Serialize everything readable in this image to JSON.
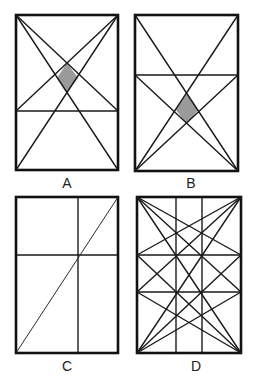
{
  "figure": {
    "panels": [
      {
        "id": "A",
        "label": "A",
        "rect": {
          "x": 16,
          "y": 15,
          "w": 102,
          "h": 155
        },
        "horizontals": [
          111
        ],
        "verticals": [],
        "shaded_region": true,
        "description": "Rectangle with horizontal line in lower part; both full diagonals plus lines from top corners to opposite ends of the horizontal line; shaded kite at intersection"
      },
      {
        "id": "B",
        "label": "B",
        "rect": {
          "x": 135,
          "y": 15,
          "w": 103,
          "h": 156
        },
        "horizontals": [
          75
        ],
        "verticals": [],
        "shaded_region": true,
        "description": "Rectangle with horizontal line in upper part; both full diagonals plus lines from bottom corners to opposite ends of the horizontal line; shaded kite at intersection"
      },
      {
        "id": "C",
        "label": "C",
        "rect": {
          "x": 16,
          "y": 197,
          "w": 102,
          "h": 156
        },
        "horizontals": [
          255
        ],
        "verticals": [
          78
        ],
        "shaded_region": false,
        "description": "Rectangle with one diagonal from bottom-left to top-right; horizontal and vertical lines cross on the diagonal"
      },
      {
        "id": "D",
        "label": "D",
        "rect": {
          "x": 137,
          "y": 197,
          "w": 104,
          "h": 156
        },
        "horizontals": [
          255,
          292
        ],
        "verticals": [
          176,
          202
        ],
        "shaded_region": false,
        "description": "Rectangle divided by two horizontal and two vertical lines; fans of lines from each corner to opposite corner and to the opposite side at each horizontal line"
      }
    ],
    "colors": {
      "stroke": "#1a1a1a",
      "shade": "#9a9a9a",
      "background": "#ffffff"
    }
  }
}
